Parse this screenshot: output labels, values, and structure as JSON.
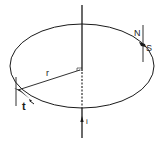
{
  "diagram": {
    "labels": {
      "radius": "r",
      "tangent": "t",
      "north": "N",
      "south": "S",
      "current": "i"
    },
    "colors": {
      "stroke": "#1a1a1a",
      "background": "#ffffff"
    }
  }
}
